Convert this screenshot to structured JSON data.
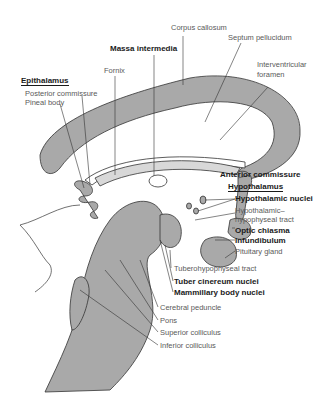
{
  "figure": {
    "fill_color": "#a9a9a9",
    "line_color": "#333333"
  },
  "labels": {
    "corpus_callosum": "Corpus callosum",
    "septum_pellucidum": "Septum pellucidum",
    "massa_intermedia": "Massa intermedia",
    "fornix": "Fornix",
    "interventricular_foramen_1": "Interventricular",
    "interventricular_foramen_2": "foramen",
    "epithalamus": "Epithalamus",
    "posterior_commissure": "Posterior commissure",
    "pineal_body": "Pineal body",
    "anterior_commissure": "Anterior commissure",
    "hypothalamus": "Hypothalamus",
    "hypothalamic_nuclei": "Hypothalamic nuclei",
    "hypothalamic_tract_1": "Hypothalamic–",
    "hypothalamic_tract_2": "hypophyseal tract",
    "optic_chiasma": "Optic chiasma",
    "infundibulum": "Infundibulum",
    "pituitary_gland": "Pituitary gland",
    "tuberohypophyseal_tract": "Tuberohypophyseal tract",
    "tuber_cinereum_nuclei": "Tuber cinereum nuclei",
    "mammillary_body_nuclei": "Mammillary body nuclei",
    "cerebral_peduncle": "Cerebral peduncle",
    "pons": "Pons",
    "superior_colliculus": "Superior colliculus",
    "inferior_colliculus": "Inferior colliculus"
  }
}
